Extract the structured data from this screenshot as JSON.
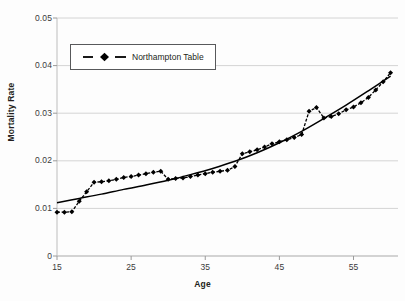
{
  "chart_data": {
    "type": "scatter",
    "title": "",
    "xlabel": "Age",
    "ylabel": "Mortality Rate",
    "xlim": [
      15,
      61
    ],
    "ylim": [
      0,
      0.05
    ],
    "xticks": [
      15,
      25,
      35,
      45,
      55
    ],
    "yticks": [
      0,
      0.01,
      0.02,
      0.03,
      0.04,
      0.05
    ],
    "ytick_labels": [
      "0",
      "0.01",
      "0.02",
      "0.03",
      "0.04",
      "0.05"
    ],
    "xtick_labels": [
      "15",
      "25",
      "35",
      "45",
      "55"
    ],
    "grid": "horizontal",
    "legend_position": "upper-left-inside",
    "series": [
      {
        "name": "Northampton Table",
        "marker": "diamond",
        "line_style": "dashed",
        "color": "#000000",
        "x": [
          15,
          16,
          17,
          18,
          19,
          20,
          21,
          22,
          23,
          24,
          25,
          26,
          27,
          28,
          29,
          30,
          31,
          32,
          33,
          34,
          35,
          36,
          37,
          38,
          39,
          40,
          41,
          42,
          43,
          44,
          45,
          46,
          47,
          48,
          49,
          50,
          51,
          52,
          53,
          54,
          55,
          56,
          57,
          58,
          59,
          60
        ],
        "values": [
          0.0092,
          0.0092,
          0.0093,
          0.0115,
          0.0135,
          0.0155,
          0.0156,
          0.0158,
          0.0161,
          0.0165,
          0.0167,
          0.017,
          0.0173,
          0.0176,
          0.0178,
          0.0161,
          0.0163,
          0.0164,
          0.0167,
          0.017,
          0.0173,
          0.0176,
          0.0178,
          0.018,
          0.0188,
          0.0215,
          0.0219,
          0.0223,
          0.0229,
          0.0236,
          0.024,
          0.0244,
          0.0249,
          0.0255,
          0.0304,
          0.0312,
          0.029,
          0.0293,
          0.0299,
          0.0307,
          0.0313,
          0.0322,
          0.0333,
          0.0349,
          0.0366,
          0.0385
        ]
      },
      {
        "name": "Fitted Trend",
        "marker": "none",
        "line_style": "solid",
        "color": "#000000",
        "x": [
          15,
          18,
          21,
          24,
          27,
          30,
          33,
          36,
          39,
          42,
          45,
          48,
          51,
          54,
          57,
          60
        ],
        "values": [
          0.0112,
          0.0121,
          0.013,
          0.014,
          0.0149,
          0.0159,
          0.0171,
          0.0184,
          0.0199,
          0.0217,
          0.0238,
          0.0262,
          0.0289,
          0.0317,
          0.0347,
          0.0378
        ]
      }
    ]
  },
  "legend": {
    "entries": [
      {
        "label": "Northampton Table",
        "marker": "diamond-marker-icon"
      }
    ]
  },
  "axes": {
    "x_title": "Age",
    "y_title": "Mortality Rate"
  }
}
